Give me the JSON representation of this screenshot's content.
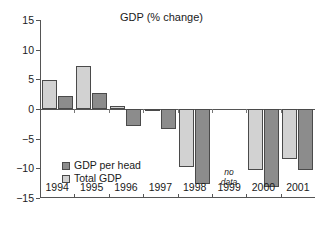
{
  "chart_data": {
    "type": "bar",
    "title": "GDP (% change)",
    "xlabel": "",
    "ylabel": "",
    "ylim": [
      -15,
      15
    ],
    "yticks": [
      15,
      10,
      5,
      0,
      -5,
      -10,
      -15
    ],
    "ytick_labels": [
      "15",
      "10",
      "5",
      "0",
      "−5",
      "−10",
      "−15"
    ],
    "grid": false,
    "legend_position": "inside-lower-left",
    "categories": [
      "1994",
      "1995",
      "1996",
      "1997",
      "1998",
      "1999",
      "2000",
      "2001"
    ],
    "series": [
      {
        "name": "Total GDP",
        "color": "#d2d2d2",
        "values": [
          4.9,
          7.2,
          0.5,
          -0.3,
          -9.7,
          null,
          -10.2,
          -8.5
        ]
      },
      {
        "name": "GDP per head",
        "color": "#8c8c8c",
        "values": [
          2.2,
          2.7,
          -2.8,
          -3.4,
          -12.6,
          null,
          -13.2,
          -10.3
        ]
      }
    ],
    "annotations": [
      {
        "text_line1": "no",
        "text_line2": "data",
        "category": "1999",
        "style": "italic"
      }
    ]
  },
  "legend": {
    "entries": [
      {
        "label": "GDP per head",
        "swatch": "perhead"
      },
      {
        "label": "Total GDP",
        "swatch": "total"
      }
    ]
  },
  "colors": {
    "total_gdp": "#d2d2d2",
    "gdp_per_head": "#8c8c8c",
    "axis": "#555555",
    "background": "#ffffff"
  }
}
